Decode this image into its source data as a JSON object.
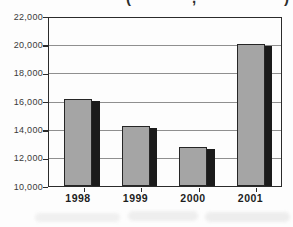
{
  "figure": {
    "clipped_caption_fragments": [
      "(",
      ",",
      ")"
    ]
  },
  "chart_data": {
    "type": "bar",
    "title": "",
    "xlabel": "",
    "ylabel": "",
    "categories": [
      "1998",
      "1999",
      "2000",
      "2001"
    ],
    "values": [
      16200,
      14300,
      12800,
      20100
    ],
    "ylim": [
      10000,
      22000
    ],
    "ytick_step": 2000,
    "ytick_labels": [
      "10,000",
      "12,000",
      "14,000",
      "16,000",
      "18,000",
      "20,000",
      "22,000"
    ],
    "grid": true,
    "legend": null,
    "colors": {
      "bar_fill": "#a5a5a5",
      "bar_border": "#262626",
      "bar_shadow": "#1b1b1b",
      "axis": "#2b2b2b",
      "gridline": "#8f8f8f",
      "tick_label": "#3a3a3a",
      "category_label": "#1e1e1e",
      "background": "#fdfdfd"
    }
  }
}
